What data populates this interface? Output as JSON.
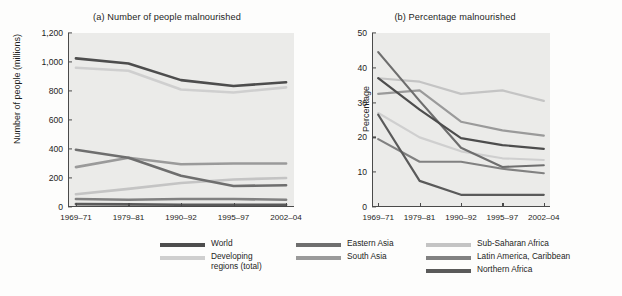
{
  "figure": {
    "background_color": "#fdfdfc",
    "plot_background_color": "#ebebe9",
    "axis_color": "#4a4a4a"
  },
  "series_colors": {
    "world": "#4d4d4d",
    "developing_regions_total": "#cfcfcf",
    "eastern_asia": "#6e6e6e",
    "south_asia": "#9a9a9a",
    "sub_saharan_africa": "#c4c4c4",
    "latin_america_caribbean": "#818181",
    "northern_africa": "#5a5a5a"
  },
  "legend": {
    "position": "bottom",
    "columns": [
      {
        "name": "legend-column-1",
        "entries": [
          {
            "label": "World",
            "key": "world",
            "color": "#4d4d4d"
          },
          {
            "label": "Developing\nregions (total)",
            "key": "developing_regions_total",
            "color": "#cfcfcf"
          }
        ]
      },
      {
        "name": "legend-column-2",
        "entries": [
          {
            "label": "Eastern Asia",
            "key": "eastern_asia",
            "color": "#6e6e6e"
          },
          {
            "label": "South Asia",
            "key": "south_asia",
            "color": "#9a9a9a"
          }
        ]
      },
      {
        "name": "legend-column-3",
        "entries": [
          {
            "label": "Sub-Saharan Africa",
            "key": "sub_saharan_africa",
            "color": "#c4c4c4"
          },
          {
            "label": "Latin America, Caribbean",
            "key": "latin_america_caribbean",
            "color": "#818181"
          },
          {
            "label": "Northern Africa",
            "key": "northern_africa",
            "color": "#5a5a5a"
          }
        ]
      }
    ]
  },
  "chart_data": [
    {
      "id": "panel-a",
      "type": "line",
      "title": "(a) Number of people malnourished",
      "xlabel": "",
      "ylabel": "Number of people (millions)",
      "categories": [
        "1969–71",
        "1979–81",
        "1990–92",
        "1995–97",
        "2002–04"
      ],
      "ylim": [
        0,
        1200
      ],
      "yticks": [
        0,
        200,
        400,
        600,
        800,
        1000,
        1200
      ],
      "ytick_labels": [
        "0",
        "200",
        "400",
        "600",
        "800",
        "1,000",
        "1,200"
      ],
      "grid": false,
      "legend": "shared-bottom",
      "series": [
        {
          "name": "World",
          "key": "world",
          "color": "#4d4d4d",
          "values": [
            1025,
            990,
            875,
            835,
            860
          ]
        },
        {
          "name": "Developing regions (total)",
          "key": "developing_regions_total",
          "color": "#cfcfcf",
          "values": [
            960,
            940,
            810,
            790,
            825
          ]
        },
        {
          "name": "Eastern Asia",
          "key": "eastern_asia",
          "color": "#6e6e6e",
          "values": [
            395,
            340,
            215,
            145,
            150
          ]
        },
        {
          "name": "South Asia",
          "key": "south_asia",
          "color": "#9a9a9a",
          "values": [
            275,
            340,
            295,
            300,
            300
          ]
        },
        {
          "name": "Sub-Saharan Africa",
          "key": "sub_saharan_africa",
          "color": "#c4c4c4",
          "values": [
            88,
            125,
            165,
            190,
            200
          ]
        },
        {
          "name": "Latin America, Caribbean",
          "key": "latin_america_caribbean",
          "color": "#818181",
          "values": [
            55,
            50,
            55,
            55,
            50
          ]
        },
        {
          "name": "Northern Africa",
          "key": "northern_africa",
          "color": "#5a5a5a",
          "values": [
            20,
            18,
            16,
            16,
            15
          ]
        }
      ]
    },
    {
      "id": "panel-b",
      "type": "line",
      "title": "(b) Percentage malnourished",
      "xlabel": "",
      "ylabel": "Percentage",
      "categories": [
        "1969–71",
        "1979–81",
        "1990–92",
        "1995–97",
        "2002–04"
      ],
      "ylim": [
        0,
        50
      ],
      "yticks": [
        0,
        10,
        20,
        30,
        40,
        50
      ],
      "ytick_labels": [
        "0",
        "10",
        "20",
        "30",
        "40",
        "50"
      ],
      "grid": false,
      "legend": "shared-bottom",
      "series": [
        {
          "name": "World",
          "key": "world",
          "color": "#4d4d4d",
          "values": [
            37,
            28,
            19.8,
            17.8,
            16.7
          ]
        },
        {
          "name": "Developing regions (total)",
          "key": "developing_regions_total",
          "color": "#cfcfcf",
          "values": [
            27,
            20,
            16,
            14,
            13.5
          ]
        },
        {
          "name": "Eastern Asia",
          "key": "eastern_asia",
          "color": "#6e6e6e",
          "values": [
            44.5,
            30.5,
            17,
            11.5,
            12
          ]
        },
        {
          "name": "South Asia",
          "key": "south_asia",
          "color": "#9a9a9a",
          "values": [
            32.5,
            33.5,
            24.5,
            22,
            20.5
          ]
        },
        {
          "name": "Sub-Saharan Africa",
          "key": "sub_saharan_africa",
          "color": "#c4c4c4",
          "values": [
            37,
            36,
            32.5,
            33.5,
            30.5
          ]
        },
        {
          "name": "Latin America, Caribbean",
          "key": "latin_america_caribbean",
          "color": "#818181",
          "values": [
            19.5,
            13,
            13,
            11,
            9.7
          ]
        },
        {
          "name": "Northern Africa",
          "key": "northern_africa",
          "color": "#5a5a5a",
          "values": [
            26.5,
            7.5,
            3.5,
            3.5,
            3.5
          ]
        }
      ]
    }
  ]
}
